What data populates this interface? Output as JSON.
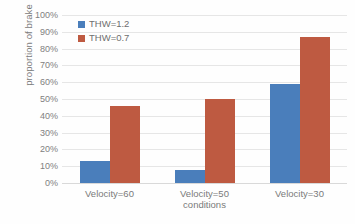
{
  "chart_data": {
    "type": "bar",
    "title": "",
    "xlabel": "conditions",
    "ylabel": "proportion of brake",
    "categories": [
      "Velocity=60",
      "Velocity=50",
      "Velocity=30"
    ],
    "series": [
      {
        "name": "THW=1.2",
        "color": "#4a7ebb",
        "values": [
          13,
          8,
          59
        ]
      },
      {
        "name": "THW=0.7",
        "color": "#be5a41",
        "values": [
          46,
          50,
          87
        ]
      }
    ],
    "ylim": [
      0,
      100
    ],
    "ytick_labels": [
      "100%",
      "90%",
      "80%",
      "70%",
      "60%",
      "50%",
      "40%",
      "30%",
      "20%",
      "10%",
      "0%"
    ],
    "ytick_values": [
      100,
      90,
      80,
      70,
      60,
      50,
      40,
      30,
      20,
      10,
      0
    ],
    "value_suffix": "%",
    "grid": "horizontal",
    "legend_position": "top-left-inside",
    "background_color": "#ffffff",
    "gridline_color": "#e6e6e6",
    "axis_text_color": "#7a7a7a"
  }
}
